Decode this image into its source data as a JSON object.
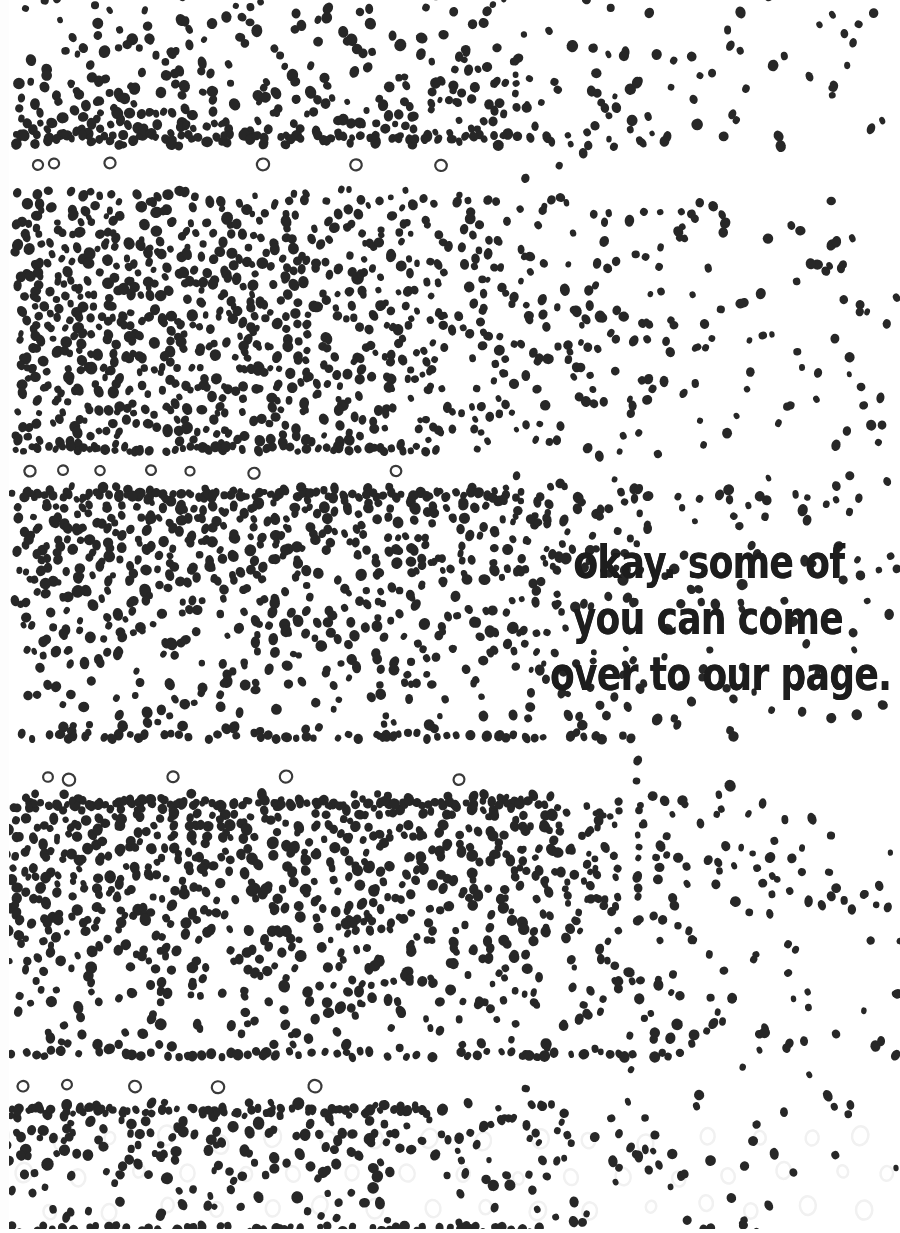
{
  "page": {
    "width": 900,
    "height": 1233,
    "background_color": "#ffffff"
  },
  "caption": {
    "full_text": "okay. some of you can come over to our page.",
    "line1": "okay. some of",
    "line2": "you can come",
    "line3": "over to our page.",
    "color": "#1d1d1d",
    "style": "handwritten-marker",
    "align": "center"
  },
  "palette": {
    "dot_color": "#272727",
    "ghost_circle_color": "#f1f1f1",
    "hollow_circle_stroke": "#3a3a3a",
    "paper": "#ffffff"
  },
  "artwork": {
    "type": "dot-gradient-bands",
    "dot_radius_min": 3.1,
    "dot_radius_max": 5.6,
    "bands": [
      {
        "name": "band-1",
        "top": -6,
        "bottom": 140,
        "dense_left_edge": 14,
        "dense_right_edge": 430,
        "fade_right_edge": 900,
        "density": 0.92,
        "vertical_profile": "denser-toward-bottom"
      },
      {
        "name": "band-2",
        "top": 196,
        "bottom": 452,
        "dense_left_edge": 14,
        "dense_right_edge": 360,
        "fade_right_edge": 900,
        "density": 1.0,
        "vertical_profile": "uniform"
      },
      {
        "name": "band-3",
        "top": 492,
        "bottom": 740,
        "dense_left_edge": 14,
        "dense_right_edge": 520,
        "fade_right_edge": 900,
        "density": 0.95,
        "vertical_profile": "denser-toward-top"
      },
      {
        "name": "band-4",
        "top": 800,
        "bottom": 1058,
        "dense_left_edge": 10,
        "dense_right_edge": 560,
        "fade_right_edge": 900,
        "density": 1.0,
        "vertical_profile": "denser-toward-top"
      },
      {
        "name": "band-5",
        "top": 1108,
        "bottom": 1233,
        "dense_left_edge": 10,
        "dense_right_edge": 430,
        "fade_right_edge": 900,
        "density": 0.62,
        "vertical_profile": "denser-toward-top"
      }
    ],
    "hollow_circle_rows": [
      {
        "name": "hollow-row-1",
        "y": 164,
        "radius": 6.0,
        "x_positions": [
          38,
          54,
          110,
          263,
          356,
          441
        ]
      },
      {
        "name": "hollow-row-2",
        "y": 472,
        "radius": 5.8,
        "x_positions": [
          30,
          63,
          100,
          151,
          190,
          254,
          396
        ]
      },
      {
        "name": "hollow-row-3",
        "y": 778,
        "radius": 6.0,
        "x_positions": [
          48,
          69,
          173,
          286,
          459
        ]
      },
      {
        "name": "hollow-row-4",
        "y": 1086,
        "radius": 6.2,
        "x_positions": [
          23,
          67,
          135,
          218,
          315
        ]
      }
    ],
    "ghost_grid": {
      "name": "faint-ghost-circles",
      "top": 1140,
      "bottom": 1233,
      "left": 0,
      "right": 900,
      "spacing_x": 54,
      "spacing_y": 34,
      "radius": 8,
      "color": "#f1f1f1"
    }
  }
}
